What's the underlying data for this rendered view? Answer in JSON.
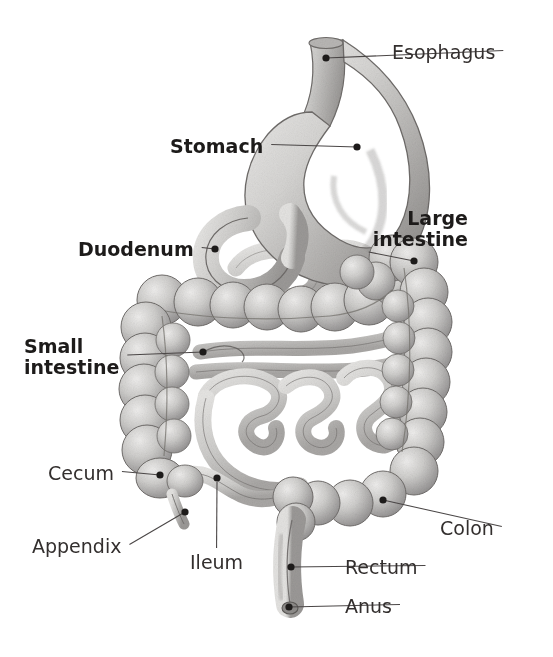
{
  "figure": {
    "style": "grayscale pencil-shaded anatomical illustration",
    "background_color": "#ffffff",
    "label_color": "#332f2e",
    "bold_label_color": "#1d1b1a",
    "leader_color": "#4a4646",
    "organ_fill": "#c9c8c6",
    "organ_shade": "#8d8b89",
    "organ_outline": "#6f6c6a"
  },
  "labels": [
    {
      "id": "esophagus",
      "text": "Esophagus",
      "bold": false,
      "align": "left",
      "x": 392,
      "y": 42,
      "dot_x": 326,
      "dot_y": 58,
      "leader": "horizontal"
    },
    {
      "id": "stomach",
      "text": "Stomach",
      "bold": true,
      "align": "left",
      "x": 170,
      "y": 136,
      "dot_x": 357,
      "dot_y": 147,
      "leader": "horizontal"
    },
    {
      "id": "duodenum",
      "text": "Duodenum",
      "bold": true,
      "align": "left",
      "x": 78,
      "y": 239,
      "dot_x": 215,
      "dot_y": 249,
      "leader": "horizontal"
    },
    {
      "id": "large-intestine",
      "text": "Large\nintestine",
      "bold": true,
      "align": "right",
      "x": 468,
      "y": 208,
      "dot_x": 414,
      "dot_y": 261,
      "leader": "diagonal"
    },
    {
      "id": "small-intestine",
      "text": "Small\nintestine",
      "bold": true,
      "align": "left",
      "x": 24,
      "y": 336,
      "dot_x": 203,
      "dot_y": 352,
      "leader": "horizontal"
    },
    {
      "id": "cecum",
      "text": "Cecum",
      "bold": false,
      "align": "left",
      "x": 48,
      "y": 463,
      "dot_x": 160,
      "dot_y": 475,
      "leader": "horizontal"
    },
    {
      "id": "appendix",
      "text": "Appendix",
      "bold": false,
      "align": "left",
      "x": 32,
      "y": 536,
      "dot_x": 185,
      "dot_y": 512,
      "leader": "diagonal"
    },
    {
      "id": "ileum",
      "text": "Ileum",
      "bold": false,
      "align": "left",
      "x": 190,
      "y": 552,
      "dot_x": 217,
      "dot_y": 478,
      "leader": "vertical"
    },
    {
      "id": "colon",
      "text": "Colon",
      "bold": false,
      "align": "left",
      "x": 440,
      "y": 518,
      "dot_x": 383,
      "dot_y": 500,
      "leader": "diagonal"
    },
    {
      "id": "rectum",
      "text": "Rectum",
      "bold": false,
      "align": "left",
      "x": 345,
      "y": 557,
      "dot_x": 291,
      "dot_y": 567,
      "leader": "horizontal"
    },
    {
      "id": "anus",
      "text": "Anus",
      "bold": false,
      "align": "left",
      "x": 345,
      "y": 596,
      "dot_x": 289,
      "dot_y": 607,
      "leader": "horizontal"
    }
  ],
  "structures": [
    {
      "id": "esophagus-tube",
      "name": "Esophagus"
    },
    {
      "id": "stomach-body",
      "name": "Stomach"
    },
    {
      "id": "duodenum-loop",
      "name": "Duodenum"
    },
    {
      "id": "ascending-colon",
      "name": "Ascending colon"
    },
    {
      "id": "transverse-colon",
      "name": "Transverse colon"
    },
    {
      "id": "descending-colon",
      "name": "Descending colon"
    },
    {
      "id": "sigmoid-colon",
      "name": "Sigmoid colon"
    },
    {
      "id": "cecum-pouch",
      "name": "Cecum"
    },
    {
      "id": "appendix-tip",
      "name": "Appendix"
    },
    {
      "id": "ileum-coil",
      "name": "Ileum"
    },
    {
      "id": "jejunum-coils",
      "name": "Small intestine coils"
    },
    {
      "id": "rectum-tube",
      "name": "Rectum"
    },
    {
      "id": "anus-opening",
      "name": "Anus"
    }
  ]
}
